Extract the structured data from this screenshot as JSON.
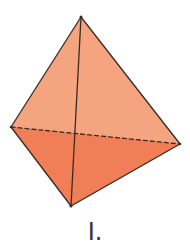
{
  "figure": {
    "label": "I.",
    "shape": "tetrahedron",
    "vertices": {
      "apex": [
        81,
        17
      ],
      "left": [
        11,
        127
      ],
      "right": [
        180,
        144
      ],
      "bottom": [
        71,
        206
      ]
    },
    "colors": {
      "upper_faces": "#F4A47F",
      "lower_faces": "#F07E56",
      "edge": "#3a2a24",
      "background": "#ffffff"
    },
    "hidden_edge": "left-right (dashed)"
  }
}
